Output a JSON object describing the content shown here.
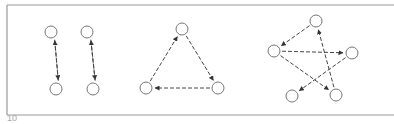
{
  "figure": {
    "label": "10",
    "frame_color": "#9a9a9a",
    "ink_color": "#444444",
    "node_radius": 6,
    "graphs": [
      {
        "name": "two-cycle-a",
        "nodes": [
          {
            "id": "a1",
            "x": 51,
            "y": 32
          },
          {
            "id": "a2",
            "x": 56,
            "y": 89
          }
        ],
        "edges": [
          {
            "from": "a1",
            "to": "a2"
          },
          {
            "from": "a2",
            "to": "a1"
          }
        ]
      },
      {
        "name": "two-cycle-b",
        "nodes": [
          {
            "id": "b1",
            "x": 87,
            "y": 32
          },
          {
            "id": "b2",
            "x": 93,
            "y": 89
          }
        ],
        "edges": [
          {
            "from": "b1",
            "to": "b2"
          },
          {
            "from": "b2",
            "to": "b1"
          }
        ]
      },
      {
        "name": "three-cycle",
        "nodes": [
          {
            "id": "t1",
            "x": 182,
            "y": 29
          },
          {
            "id": "t2",
            "x": 218,
            "y": 88
          },
          {
            "id": "t3",
            "x": 146,
            "y": 88
          }
        ],
        "edges": [
          {
            "from": "t1",
            "to": "t2"
          },
          {
            "from": "t2",
            "to": "t3"
          },
          {
            "from": "t3",
            "to": "t1"
          }
        ]
      },
      {
        "name": "five-cycle-star",
        "nodes": [
          {
            "id": "s1",
            "x": 316,
            "y": 21
          },
          {
            "id": "s2",
            "x": 274,
            "y": 51
          },
          {
            "id": "s3",
            "x": 352,
            "y": 53
          },
          {
            "id": "s4",
            "x": 292,
            "y": 96
          },
          {
            "id": "s5",
            "x": 336,
            "y": 95
          }
        ],
        "edges": [
          {
            "from": "s1",
            "to": "s2"
          },
          {
            "from": "s2",
            "to": "s3"
          },
          {
            "from": "s3",
            "to": "s4"
          },
          {
            "from": "s2",
            "to": "s5"
          },
          {
            "from": "s5",
            "to": "s1"
          }
        ]
      }
    ]
  }
}
